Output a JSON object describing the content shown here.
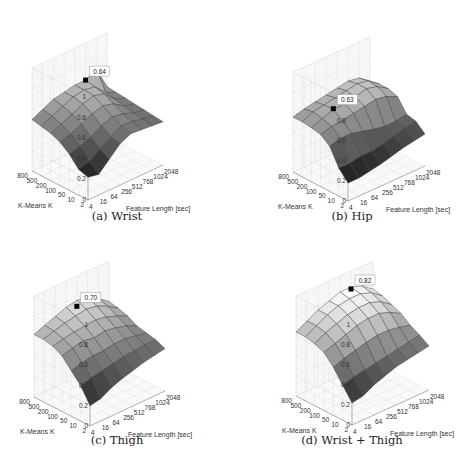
{
  "chart_data": [
    {
      "type": "surface3d",
      "title": "(a) Wrist",
      "xlabel": "Feature Length [sec]",
      "ylabel": "K-Means K",
      "zlabel": "",
      "x_ticks": [
        "4",
        "16",
        "64",
        "256",
        "512",
        "768",
        "1024",
        "2048"
      ],
      "y_ticks": [
        "2",
        "10",
        "50",
        "100",
        "200",
        "500",
        "800"
      ],
      "z_ticks": [
        "0",
        "0.2",
        "0.4",
        "0.6",
        "0.8",
        "1"
      ],
      "zlim": [
        0,
        1
      ],
      "annotation": {
        "label": "0.64",
        "x": "768",
        "y": "800",
        "value": 0.64
      },
      "z": [
        [
          0.22,
          0.2,
          0.3,
          0.4,
          0.45,
          0.44,
          0.43,
          0.42
        ],
        [
          0.25,
          0.28,
          0.35,
          0.42,
          0.48,
          0.47,
          0.45,
          0.43
        ],
        [
          0.35,
          0.38,
          0.42,
          0.48,
          0.52,
          0.5,
          0.46,
          0.44
        ],
        [
          0.42,
          0.45,
          0.5,
          0.55,
          0.58,
          0.55,
          0.48,
          0.45
        ],
        [
          0.46,
          0.5,
          0.55,
          0.6,
          0.63,
          0.6,
          0.5,
          0.46
        ],
        [
          0.48,
          0.53,
          0.58,
          0.62,
          0.64,
          0.62,
          0.52,
          0.47
        ],
        [
          0.5,
          0.55,
          0.6,
          0.62,
          0.64,
          0.64,
          0.7,
          0.48
        ]
      ]
    },
    {
      "type": "surface3d",
      "title": "(b) Hip",
      "xlabel": "Feature Length [sec]",
      "ylabel": "K-Means K",
      "zlabel": "",
      "x_ticks": [
        "4",
        "16",
        "64",
        "256",
        "512",
        "768",
        "1024",
        "2048"
      ],
      "y_ticks": [
        "2",
        "10",
        "50",
        "100",
        "200",
        "500",
        "800"
      ],
      "z_ticks": [
        "0",
        "0.2",
        "0.4",
        "0.6",
        "0.8",
        "1"
      ],
      "zlim": [
        0,
        1
      ],
      "annotation": {
        "label": "0.63",
        "x": "64",
        "y": "200",
        "value": 0.63
      },
      "z": [
        [
          0.18,
          0.18,
          0.2,
          0.22,
          0.25,
          0.28,
          0.3,
          0.32
        ],
        [
          0.28,
          0.28,
          0.3,
          0.3,
          0.32,
          0.35,
          0.38,
          0.4
        ],
        [
          0.45,
          0.48,
          0.48,
          0.45,
          0.42,
          0.4,
          0.4,
          0.42
        ],
        [
          0.52,
          0.55,
          0.56,
          0.58,
          0.6,
          0.62,
          0.6,
          0.55
        ],
        [
          0.54,
          0.58,
          0.62,
          0.63,
          0.65,
          0.68,
          0.65,
          0.58
        ],
        [
          0.55,
          0.6,
          0.62,
          0.64,
          0.66,
          0.68,
          0.66,
          0.58
        ],
        [
          0.55,
          0.58,
          0.6,
          0.62,
          0.64,
          0.66,
          0.64,
          0.56
        ]
      ]
    },
    {
      "type": "surface3d",
      "title": "(c) Thigh",
      "xlabel": "Feature Length [sec]",
      "ylabel": "K-Means K",
      "zlabel": "",
      "x_ticks": [
        "4",
        "16",
        "64",
        "256",
        "512",
        "768",
        "1024",
        "2048"
      ],
      "y_ticks": [
        "2",
        "10",
        "50",
        "100",
        "200",
        "500",
        "800"
      ],
      "z_ticks": [
        "0",
        "0.2",
        "0.4",
        "0.6",
        "0.8",
        "1"
      ],
      "zlim": [
        0,
        1
      ],
      "annotation": {
        "label": "0.70",
        "x": "512",
        "y": "800",
        "value": 0.7
      },
      "z": [
        [
          0.2,
          0.22,
          0.28,
          0.32,
          0.35,
          0.38,
          0.4,
          0.42
        ],
        [
          0.35,
          0.38,
          0.4,
          0.42,
          0.44,
          0.45,
          0.46,
          0.46
        ],
        [
          0.45,
          0.48,
          0.5,
          0.5,
          0.52,
          0.52,
          0.5,
          0.48
        ],
        [
          0.55,
          0.58,
          0.6,
          0.58,
          0.6,
          0.58,
          0.55,
          0.5
        ],
        [
          0.6,
          0.62,
          0.64,
          0.65,
          0.66,
          0.64,
          0.6,
          0.55
        ],
        [
          0.62,
          0.65,
          0.68,
          0.7,
          0.72,
          0.7,
          0.65,
          0.58
        ],
        [
          0.62,
          0.66,
          0.7,
          0.74,
          0.76,
          0.74,
          0.68,
          0.6
        ]
      ]
    },
    {
      "type": "surface3d",
      "title": "(d) Wrist + Thigh",
      "xlabel": "Feature Length [sec]",
      "ylabel": "K-Means K",
      "zlabel": "",
      "x_ticks": [
        "4",
        "16",
        "64",
        "256",
        "512",
        "768",
        "1024",
        "2048"
      ],
      "y_ticks": [
        "2",
        "10",
        "50",
        "100",
        "200",
        "500",
        "800"
      ],
      "z_ticks": [
        "0",
        "0.2",
        "0.4",
        "0.6",
        "0.8",
        "1"
      ],
      "zlim": [
        0,
        1
      ],
      "annotation": {
        "label": "0.82",
        "x": "768",
        "y": "800",
        "value": 0.82
      },
      "z": [
        [
          0.22,
          0.24,
          0.3,
          0.34,
          0.38,
          0.4,
          0.42,
          0.44
        ],
        [
          0.35,
          0.38,
          0.4,
          0.42,
          0.44,
          0.46,
          0.48,
          0.5
        ],
        [
          0.48,
          0.52,
          0.55,
          0.58,
          0.6,
          0.6,
          0.58,
          0.55
        ],
        [
          0.58,
          0.62,
          0.66,
          0.7,
          0.72,
          0.72,
          0.68,
          0.62
        ],
        [
          0.62,
          0.68,
          0.72,
          0.76,
          0.78,
          0.78,
          0.74,
          0.66
        ],
        [
          0.64,
          0.7,
          0.76,
          0.8,
          0.82,
          0.82,
          0.78,
          0.7
        ],
        [
          0.64,
          0.7,
          0.76,
          0.8,
          0.84,
          0.84,
          0.8,
          0.72
        ]
      ]
    }
  ],
  "panels": [
    {
      "caption": "(a)  Wrist"
    },
    {
      "caption": "(b)  Hip"
    },
    {
      "caption": "(c)  Thigh"
    },
    {
      "caption": "(d)  Wrist + Thigh"
    }
  ]
}
